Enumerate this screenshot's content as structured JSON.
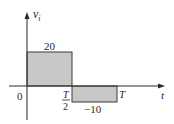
{
  "figure": {
    "type": "square-wave",
    "axes": {
      "y_label": "v",
      "y_label_subscript": "i",
      "x_label": "t",
      "origin_label": "0"
    },
    "segments": [
      {
        "from": "0",
        "to": "T/2",
        "value": 20,
        "value_label": "20"
      },
      {
        "from": "T/2",
        "to": "T",
        "value": -10,
        "value_label": "−10"
      }
    ],
    "ticks": {
      "half_period_num": "T",
      "half_period_den": "2",
      "period": "T"
    },
    "colors": {
      "fill": "#c8c8c8",
      "stroke": "#3a3a3a",
      "axis": "#2a2a2a"
    }
  }
}
